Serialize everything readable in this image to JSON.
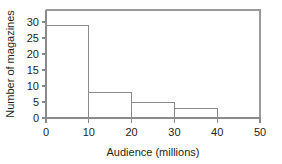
{
  "chart_data": {
    "type": "bar",
    "title": "",
    "subtitle": "",
    "xlabel": "Audience (millions)",
    "ylabel": "Number of magazines",
    "categories": [
      "0–10",
      "10–20",
      "20–30",
      "30–40",
      "40–50"
    ],
    "bin_edges": [
      0,
      10,
      20,
      30,
      40,
      50
    ],
    "values": [
      29,
      8,
      5,
      3,
      0
    ],
    "xlim": [
      0,
      50
    ],
    "ylim": [
      0,
      34
    ],
    "xticks": [
      0,
      10,
      20,
      30,
      40,
      50
    ],
    "xtick_labels": [
      "0",
      "10",
      "20",
      "30",
      "40",
      "50"
    ],
    "yticks": [
      0,
      5,
      10,
      15,
      20,
      25,
      30
    ],
    "ytick_labels": [
      "0",
      "5",
      "10",
      "15",
      "20",
      "25",
      "30"
    ],
    "grid": false,
    "legend": null,
    "legend_position": "none",
    "annotations": [],
    "colors": {
      "bar_fill": "#ffffff",
      "bar_stroke": "#8a8a8a",
      "axis": "#8a8a8a",
      "frame": "#9a9a9a",
      "text": "#231f20",
      "background": "#ffffff"
    }
  },
  "figure": {
    "background": "#ffffff"
  }
}
